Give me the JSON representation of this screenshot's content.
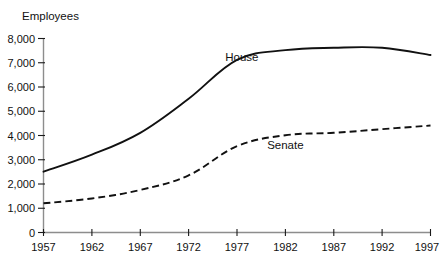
{
  "chart_data": {
    "type": "line",
    "title": "",
    "xlabel": "",
    "ylabel": "Employees",
    "x": [
      1957,
      1962,
      1967,
      1972,
      1977,
      1982,
      1987,
      1992,
      1997
    ],
    "categories": [
      "1957",
      "1962",
      "1967",
      "1972",
      "1977",
      "1982",
      "1987",
      "1992",
      "1997"
    ],
    "series": [
      {
        "name": "House",
        "style": "solid",
        "color": "#111111",
        "values": [
          2500,
          3200,
          4100,
          5500,
          7100,
          7500,
          7600,
          7600,
          7300
        ]
      },
      {
        "name": "Senate",
        "style": "dashed",
        "color": "#111111",
        "values": [
          1200,
          1400,
          1750,
          2350,
          3550,
          4000,
          4100,
          4250,
          4400
        ]
      }
    ],
    "ylim": [
      0,
      8000
    ],
    "ytick_values": [
      0,
      1000,
      2000,
      3000,
      4000,
      5000,
      6000,
      7000,
      8000
    ],
    "ytick_labels": [
      "0",
      "1,000",
      "2,000",
      "3,000",
      "4,000",
      "5,000",
      "6,000",
      "7,000",
      "8,000"
    ],
    "xlim": [
      1957,
      1997
    ],
    "grid": false,
    "legend": "inline-labels",
    "annotations": [
      {
        "text": "House",
        "x": 1977.5,
        "y": 7050,
        "name": "house-series-label"
      },
      {
        "text": "Senate",
        "x": 1982.0,
        "y": 3450,
        "name": "senate-series-label"
      }
    ],
    "axis_color": "#8d8d8d",
    "text_color": "#111111",
    "background_color": "#ffffff"
  }
}
